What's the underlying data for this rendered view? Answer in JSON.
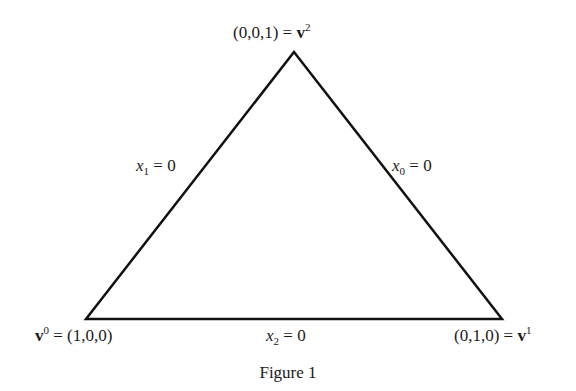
{
  "figure": {
    "caption": "Figure 1",
    "vertices": {
      "top": {
        "coords": "(0,0,1)",
        "eq": "=",
        "name": "v",
        "index": "2"
      },
      "left": {
        "name": "v",
        "index": "0",
        "eq": "=",
        "coords": "(1,0,0)"
      },
      "right": {
        "coords": "(0,1,0)",
        "eq": "=",
        "name": "v",
        "index": "1"
      }
    },
    "edges": {
      "left": {
        "var": "x",
        "sub": "1",
        "rhs": "= 0"
      },
      "right": {
        "var": "x",
        "sub": "0",
        "rhs": "= 0"
      },
      "bottom": {
        "var": "x",
        "sub": "2",
        "rhs": "= 0"
      }
    },
    "triangle": {
      "stroke": "#111111",
      "points": [
        [
          294,
          52
        ],
        [
          86,
          319
        ],
        [
          502,
          319
        ]
      ]
    }
  }
}
